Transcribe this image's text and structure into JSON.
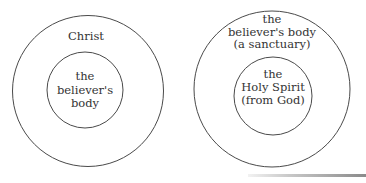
{
  "diagrams": [
    {
      "outer": {
        "label_lines": [
          "Christ"
        ]
      },
      "inner": {
        "label_lines": [
          "the",
          "believer's",
          "body"
        ]
      }
    },
    {
      "outer": {
        "label_lines": [
          "the",
          "believer's body",
          "(a sanctuary)"
        ]
      },
      "inner": {
        "label_lines": [
          "the",
          "Holy Spirit",
          "(from God)"
        ]
      }
    }
  ],
  "colors": {
    "stroke": "#4a4a4a",
    "text": "#333333",
    "background": "#ffffff"
  }
}
